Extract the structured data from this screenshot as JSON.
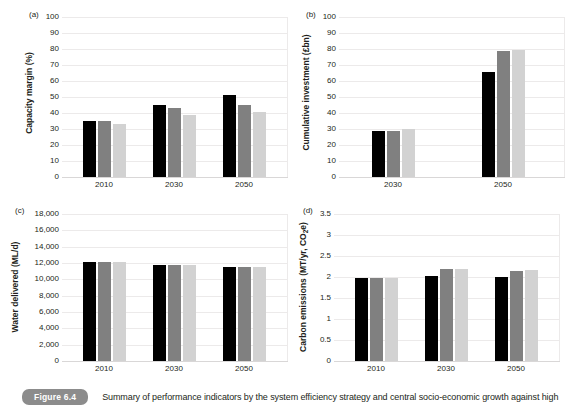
{
  "figure": {
    "badge": "Figure 6.4",
    "caption": "Summary of performance indicators by the system efficiency strategy and central socio-economic growth against high"
  },
  "panels": [
    {
      "tag": "(a)",
      "ylabel": "Capacity margin (%)",
      "ylabel_sub": "",
      "yticks": [
        "100",
        "90",
        "80",
        "70",
        "60",
        "50",
        "40",
        "30",
        "20",
        "10",
        "0"
      ],
      "xticks": [
        "2010",
        "2030",
        "2050"
      ]
    },
    {
      "tag": "(b)",
      "ylabel": "Cumulative investment (£bn)",
      "ylabel_sub": "",
      "yticks": [
        "100",
        "90",
        "80",
        "70",
        "60",
        "50",
        "40",
        "30",
        "20",
        "10",
        "0"
      ],
      "xticks": [
        "2030",
        "2050"
      ]
    },
    {
      "tag": "(c)",
      "ylabel": "Water delivered (ML/d)",
      "ylabel_sub": "",
      "yticks": [
        "18,000",
        "16,000",
        "14,000",
        "12,000",
        "10,000",
        "8,000",
        "6,000",
        "4,000",
        "2,000",
        "0"
      ],
      "xticks": [
        "2010",
        "2030",
        "2050"
      ]
    },
    {
      "tag": "(d)",
      "ylabel": "Carbon emissions (MT/yr, CO",
      "ylabel_sub": "2",
      "ylabel_tail": "e)",
      "yticks": [
        "3.5",
        "3",
        "2.5",
        "2",
        "1.5",
        "1",
        "0.5",
        "0"
      ],
      "xticks": [
        "2010",
        "2030",
        "2050"
      ]
    }
  ],
  "colors": {
    "series_0": "#000000",
    "series_1": "#808080",
    "series_2": "#d2d2d2",
    "gridline": "#eceaea",
    "text": "#231f20",
    "badge_background": "#8c8c8c"
  },
  "chart_data": [
    {
      "type": "bar",
      "panel": "(a)",
      "title": "",
      "xlabel": "",
      "ylabel": "Capacity margin (%)",
      "categories": [
        "2010",
        "2030",
        "2050"
      ],
      "series": [
        {
          "name": "series-1-black",
          "values": [
            35,
            45,
            51
          ]
        },
        {
          "name": "series-2-dark-grey",
          "values": [
            35,
            43,
            45
          ]
        },
        {
          "name": "series-3-light-grey",
          "values": [
            33,
            39,
            40.5
          ]
        }
      ],
      "ylim": [
        0,
        100
      ],
      "ytick_step": 10,
      "grid": true,
      "legend": "none"
    },
    {
      "type": "bar",
      "panel": "(b)",
      "title": "",
      "xlabel": "",
      "ylabel": "Cumulative investment (£bn)",
      "categories": [
        "2030",
        "2050"
      ],
      "series": [
        {
          "name": "series-1-black",
          "values": [
            28.5,
            65.5
          ]
        },
        {
          "name": "series-2-dark-grey",
          "values": [
            28.5,
            79
          ]
        },
        {
          "name": "series-3-light-grey",
          "values": [
            30,
            79.5
          ]
        }
      ],
      "ylim": [
        0,
        100
      ],
      "ytick_step": 10,
      "grid": true,
      "legend": "none"
    },
    {
      "type": "bar",
      "panel": "(c)",
      "title": "",
      "xlabel": "",
      "ylabel": "Water delivered (ML/d)",
      "categories": [
        "2010",
        "2030",
        "2050"
      ],
      "series": [
        {
          "name": "series-1-black",
          "values": [
            12150,
            11800,
            11520
          ]
        },
        {
          "name": "series-2-dark-grey",
          "values": [
            12130,
            11790,
            11500
          ]
        },
        {
          "name": "series-3-light-grey",
          "values": [
            12120,
            11780,
            11490
          ]
        }
      ],
      "ylim": [
        0,
        18000
      ],
      "ytick_step": 2000,
      "grid": true,
      "legend": "none"
    },
    {
      "type": "bar",
      "panel": "(d)",
      "title": "",
      "xlabel": "",
      "ylabel": "Carbon emissions (MT/yr, CO2e)",
      "categories": [
        "2010",
        "2030",
        "2050"
      ],
      "series": [
        {
          "name": "series-1-black",
          "values": [
            1.98,
            2.03,
            2.0
          ]
        },
        {
          "name": "series-2-dark-grey",
          "values": [
            1.98,
            2.19,
            2.15
          ]
        },
        {
          "name": "series-3-light-grey",
          "values": [
            1.98,
            2.19,
            2.17
          ]
        }
      ],
      "ylim": [
        0,
        3.5
      ],
      "ytick_step": 0.5,
      "grid": true,
      "legend": "none"
    }
  ]
}
